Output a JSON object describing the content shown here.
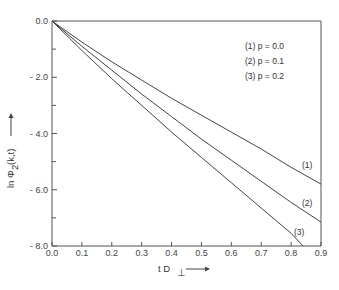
{
  "chart_data": {
    "type": "line",
    "title": "",
    "xlabel": "t D⊥",
    "ylabel": "ln Φ₂(k,t)",
    "xlim": [
      0.0,
      0.9
    ],
    "ylim": [
      -8.0,
      0.0
    ],
    "x_ticks": [
      "0.0",
      "0.1",
      "0.2",
      "0.3",
      "0.4",
      "0.5",
      "0.6",
      "0.7",
      "0.8",
      "0.9"
    ],
    "y_ticks": [
      "0.0",
      "-2.0",
      "-4.0",
      "-6.0",
      "-8.0"
    ],
    "grid": false,
    "legend_position": "upper right",
    "legend": [
      "(1) p = 0.0",
      "(2) p = 0.1",
      "(3) p = 0.2"
    ],
    "series": [
      {
        "name": "(1) p = 0.0",
        "label": "(1)",
        "x": [
          0.0,
          0.1,
          0.2,
          0.3,
          0.4,
          0.5,
          0.6,
          0.7,
          0.8,
          0.9
        ],
        "values": [
          0.0,
          -0.75,
          -1.45,
          -2.1,
          -2.75,
          -3.35,
          -3.95,
          -4.55,
          -5.2,
          -5.8
        ]
      },
      {
        "name": "(2) p = 0.1",
        "label": "(2)",
        "x": [
          0.0,
          0.1,
          0.2,
          0.3,
          0.4,
          0.5,
          0.6,
          0.7,
          0.8,
          0.9
        ],
        "values": [
          0.0,
          -0.9,
          -1.75,
          -2.6,
          -3.4,
          -4.2,
          -4.95,
          -5.7,
          -6.45,
          -7.15
        ]
      },
      {
        "name": "(3) p = 0.2",
        "label": "(3)",
        "x": [
          0.0,
          0.1,
          0.2,
          0.3,
          0.4,
          0.5,
          0.6,
          0.7,
          0.8,
          0.84
        ],
        "values": [
          0.0,
          -1.05,
          -2.05,
          -3.0,
          -3.95,
          -4.85,
          -5.75,
          -6.65,
          -7.55,
          -8.0
        ]
      }
    ]
  },
  "legend": {
    "item1": "(1) p = 0.0",
    "item2": "(2) p = 0.1",
    "item3": "(3) p = 0.2"
  },
  "curve_labels": {
    "c1": "(1)",
    "c2": "(2)",
    "c3": "(3)"
  },
  "axes": {
    "xlabel": "t D",
    "xlabel_sub": "⊥",
    "ylabel": "ln Φ",
    "ylabel_sub": "2",
    "ylabel_args": "(k,t)",
    "arrow": "⟶"
  }
}
